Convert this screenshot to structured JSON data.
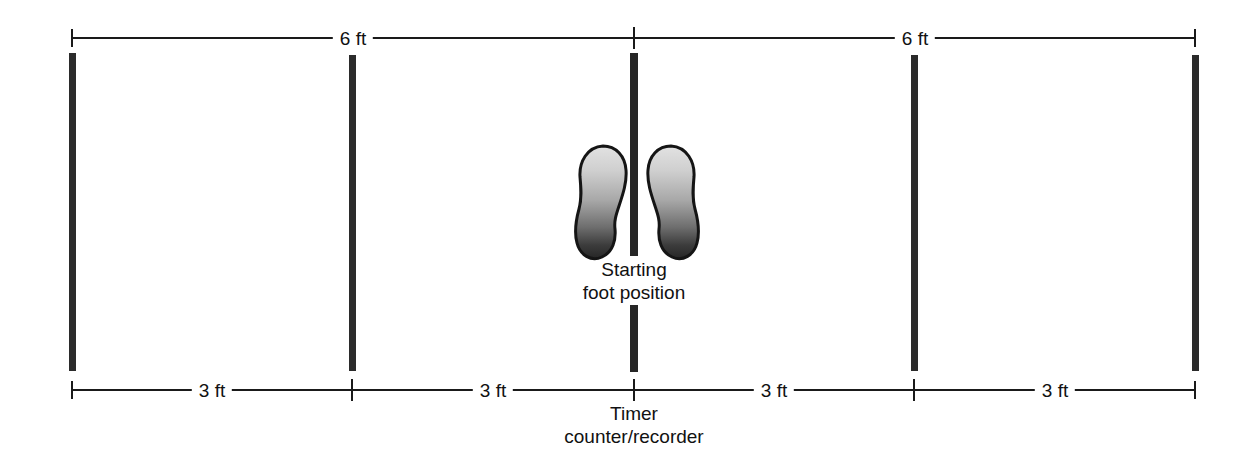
{
  "diagram": {
    "title_visible": false,
    "top_dimensions": [
      {
        "label": "6 ft",
        "from_x": 72,
        "to_x": 634
      },
      {
        "label": "6 ft",
        "from_x": 634,
        "to_x": 1195
      }
    ],
    "bottom_dimensions": [
      {
        "label": "3 ft",
        "from_x": 72,
        "to_x": 352
      },
      {
        "label": "3 ft",
        "from_x": 352,
        "to_x": 634
      },
      {
        "label": "3 ft",
        "from_x": 634,
        "to_x": 914
      },
      {
        "label": "3 ft",
        "from_x": 914,
        "to_x": 1195
      }
    ],
    "markers": [
      {
        "name": "marker-bar-1",
        "x": 72
      },
      {
        "name": "marker-bar-2",
        "x": 352
      },
      {
        "name": "marker-bar-center",
        "x": 634
      },
      {
        "name": "marker-bar-4",
        "x": 914
      },
      {
        "name": "marker-bar-5",
        "x": 1195
      }
    ],
    "annotations": {
      "start_line1": "Starting",
      "start_line2": "foot position",
      "timer_line1": "Timer",
      "timer_line2": "counter/recorder"
    },
    "feet": {
      "left_label": "left-footprint",
      "right_label": "right-footprint"
    },
    "colors": {
      "line": "#1a1a1a",
      "bar": "#2b2b2b",
      "foot_outline": "#1a1a1a",
      "foot_gradient_top": "#d8d8d8",
      "foot_gradient_bottom": "#2e2e2e",
      "background": "#ffffff"
    }
  }
}
